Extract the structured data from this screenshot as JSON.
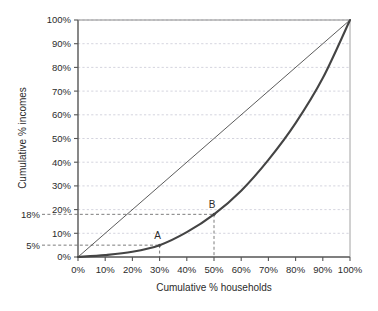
{
  "chart_data": {
    "type": "line",
    "title": "",
    "xlabel": "Cumulative % households",
    "ylabel": "Cumulative % incomes",
    "xlim": [
      0,
      100
    ],
    "ylim": [
      0,
      100
    ],
    "grid": true,
    "legend_position": "none",
    "x_tick_labels": [
      "0%",
      "10%",
      "20%",
      "30%",
      "40%",
      "50%",
      "60%",
      "70%",
      "80%",
      "90%",
      "100%"
    ],
    "x_tick_values": [
      0,
      10,
      20,
      30,
      40,
      50,
      60,
      70,
      80,
      90,
      100
    ],
    "y_tick_labels": [
      "0%",
      "10%",
      "20%",
      "30%",
      "40%",
      "50%",
      "60%",
      "70%",
      "80%",
      "90%",
      "100%"
    ],
    "y_tick_values": [
      0,
      10,
      20,
      30,
      40,
      50,
      60,
      70,
      80,
      90,
      100
    ],
    "extra_y_tick_labels": [
      "5%",
      "18%"
    ],
    "extra_y_tick_values": [
      5,
      18
    ],
    "series": [
      {
        "name": "Line of equality",
        "style": "thin-solid",
        "color": "#4a4a4a",
        "x": [
          0,
          100
        ],
        "values": [
          0,
          100
        ]
      },
      {
        "name": "Lorenz curve",
        "style": "thick-solid",
        "color": "#444444",
        "x": [
          0,
          10,
          20,
          30,
          40,
          50,
          60,
          70,
          80,
          90,
          100
        ],
        "values": [
          0,
          0.8,
          2.2,
          5,
          10.5,
          18,
          28,
          41,
          56.5,
          75.5,
          100
        ]
      }
    ],
    "annotations": [
      {
        "label": "A",
        "x": 30,
        "y": 5,
        "marker": true,
        "leader_lines": [
          "vertical",
          "horizontal"
        ]
      },
      {
        "label": "B",
        "x": 50,
        "y": 18,
        "marker": true,
        "leader_lines": [
          "vertical",
          "horizontal"
        ]
      }
    ],
    "colors": {
      "background": "#ffffff",
      "axis": "#555555",
      "gridline": "#c9c9d6",
      "leader_line": "#6e6e6e",
      "curve": "#444444",
      "equality_line": "#4a4a4a",
      "text": "#2b2b2b"
    }
  }
}
